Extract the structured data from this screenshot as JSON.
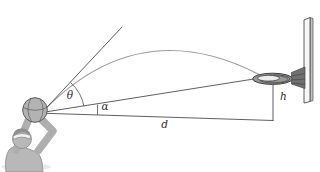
{
  "figure": {
    "labels": {
      "launch_angle": "θ",
      "sight_angle": "α",
      "horizontal_distance": "d",
      "rim_height_offset": "h"
    },
    "colors": {
      "background": "#ffffff",
      "geometry_line": "#4d4d4d",
      "trajectory_line": "#9b9b9b",
      "label_text": "#2e2e2e",
      "ball_gray": "#b3b3b3",
      "player_gray": "#b8b8b8",
      "hair_gray": "#8f8f8f",
      "headband_white": "#f2f2f2",
      "shadow_gray": "#e0e0e0",
      "rim_gray": "#9a9a9a",
      "rim_opening": "#ececec",
      "bracket_gray": "#707070",
      "backboard_face": "#f7f7f7",
      "backboard_side": "#c2c2c2"
    }
  }
}
